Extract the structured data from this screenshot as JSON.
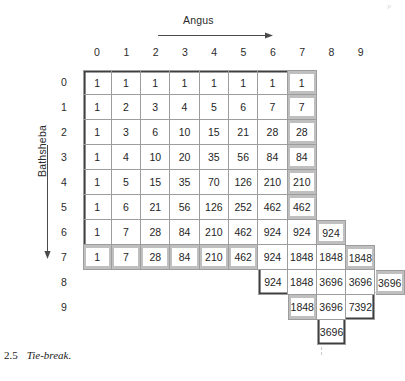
{
  "figure": {
    "caption_number": "2.5",
    "caption_text": "Tie-break.",
    "corner_mark": "p"
  },
  "axes": {
    "x_title": "Angus",
    "y_title": "Bathsheba",
    "x_arrow_icon": "arrow-right-icon",
    "y_arrow_icon": "arrow-down-icon",
    "column_headers": [
      "0",
      "1",
      "2",
      "3",
      "4",
      "5",
      "6",
      "7",
      "8",
      "9"
    ],
    "row_headers": [
      "0",
      "1",
      "2",
      "3",
      "4",
      "5",
      "6",
      "7",
      "8",
      "9"
    ]
  },
  "chart_data": {
    "type": "table",
    "title": "Tie-break",
    "xlabel": "Angus",
    "ylabel": "Bathsheba",
    "categories": [
      "0",
      "1",
      "2",
      "3",
      "4",
      "5",
      "6",
      "7",
      "8",
      "9"
    ],
    "rows": [
      {
        "label": "0",
        "start_col": 0,
        "values": [
          "1",
          "1",
          "1",
          "1",
          "1",
          "1",
          "1",
          "1"
        ],
        "highlight_cols": [
          7
        ]
      },
      {
        "label": "1",
        "start_col": 0,
        "values": [
          "1",
          "2",
          "3",
          "4",
          "5",
          "6",
          "7",
          "7"
        ],
        "highlight_cols": [
          7
        ]
      },
      {
        "label": "2",
        "start_col": 0,
        "values": [
          "1",
          "3",
          "6",
          "10",
          "15",
          "21",
          "28",
          "28"
        ],
        "highlight_cols": [
          7
        ]
      },
      {
        "label": "3",
        "start_col": 0,
        "values": [
          "1",
          "4",
          "10",
          "20",
          "35",
          "56",
          "84",
          "84"
        ],
        "highlight_cols": [
          7
        ]
      },
      {
        "label": "4",
        "start_col": 0,
        "values": [
          "1",
          "5",
          "15",
          "35",
          "70",
          "126",
          "210",
          "210"
        ],
        "highlight_cols": [
          7
        ]
      },
      {
        "label": "5",
        "start_col": 0,
        "values": [
          "1",
          "6",
          "21",
          "56",
          "126",
          "252",
          "462",
          "462"
        ],
        "highlight_cols": [
          7
        ]
      },
      {
        "label": "6",
        "start_col": 0,
        "values": [
          "1",
          "7",
          "28",
          "84",
          "210",
          "462",
          "924",
          "924",
          "924"
        ],
        "highlight_cols": [
          8
        ]
      },
      {
        "label": "7",
        "start_col": 0,
        "values": [
          "1",
          "7",
          "28",
          "84",
          "210",
          "462",
          "924",
          "1848",
          "1848",
          "1848"
        ],
        "highlight_cols": [
          0,
          1,
          2,
          3,
          4,
          5,
          9
        ]
      },
      {
        "label": "8",
        "start_col": 6,
        "values": [
          "924",
          "1848",
          "3696",
          "3696",
          "3696"
        ],
        "highlight_cols": [
          10
        ]
      },
      {
        "label": "9",
        "start_col": 7,
        "values": [
          "1848",
          "3696",
          "7392"
        ],
        "highlight_cols": [
          7
        ]
      },
      {
        "label": "",
        "start_col": 8,
        "values": [
          "3696"
        ],
        "highlight_cols": []
      }
    ]
  }
}
